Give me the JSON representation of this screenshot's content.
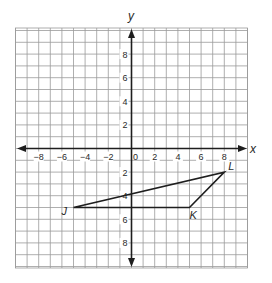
{
  "figure": {
    "type": "coordinate-plane",
    "x_axis_label": "x",
    "y_axis_label": "y",
    "x_range": [
      -10,
      10
    ],
    "y_range": [
      -10,
      10
    ],
    "grid": true,
    "x_tick_labels": [
      "−8",
      "−6",
      "−4",
      "−2",
      "0",
      "2",
      "4",
      "6",
      "8"
    ],
    "x_tick_values": [
      -8,
      -6,
      -4,
      -2,
      0,
      2,
      4,
      6,
      8
    ],
    "y_tick_labels": [
      "8",
      "6",
      "4",
      "2",
      "2",
      "4",
      "6",
      "8"
    ],
    "y_tick_values": [
      8,
      6,
      4,
      2,
      -2,
      -4,
      -6,
      -8
    ],
    "polygon": {
      "name": "triangle JKL",
      "vertices": [
        {
          "label": "J",
          "x": -5,
          "y": -5
        },
        {
          "label": "K",
          "x": 5,
          "y": -5
        },
        {
          "label": "L",
          "x": 8,
          "y": -2
        }
      ]
    },
    "colors": {
      "grid": "#9a9a9a",
      "axis": "#1e1e1e",
      "shape": "#1e1e1e",
      "background": "#ffffff"
    }
  }
}
